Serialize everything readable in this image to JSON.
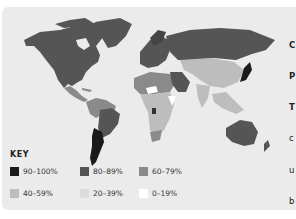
{
  "map": {
    "type": "choropleth-world",
    "legend_title": "KEY",
    "legend": [
      {
        "label": "90–100%",
        "color": "#1a1a1a"
      },
      {
        "label": "80–89%",
        "color": "#555555"
      },
      {
        "label": "60–79%",
        "color": "#8a8a8a"
      },
      {
        "label": "40–59%",
        "color": "#bdbdbd"
      },
      {
        "label": "20–39%",
        "color": "#dcdcdc"
      },
      {
        "label": "0–19%",
        "color": "#ffffff"
      }
    ],
    "regions": {
      "north_america": "80–89%",
      "greenland": "80–89%",
      "central_america": "60–79%",
      "south_america_north": "60–79%",
      "brazil": "80–89%",
      "argentina": "90–100%",
      "europe": "80–89%",
      "russia": "80–89%",
      "central_asia_china": "40–59%",
      "india": "40–59%",
      "japan": "90–100%",
      "southeast_asia": "40–59%",
      "north_africa": "60–79%",
      "middle_east_saudi": "80–89%",
      "sub_saharan_africa": "40–59%",
      "south_africa": "60–79%",
      "australia": "80–89%",
      "new_zealand": "80–89%"
    }
  },
  "side_text": {
    "lines": [
      "C",
      "P",
      "T",
      "c",
      "u",
      "b",
      "r",
      "N",
      "t",
      "t",
      "i",
      "v",
      "is",
      "3"
    ]
  }
}
